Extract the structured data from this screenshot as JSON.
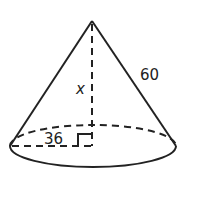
{
  "diagram": {
    "shape": "right circular cone",
    "labels": {
      "slant_height": "60",
      "height": "x",
      "radius": "36"
    },
    "right_angle_marker": true,
    "colors": {
      "stroke": "#222222",
      "background": "#ffffff"
    }
  }
}
